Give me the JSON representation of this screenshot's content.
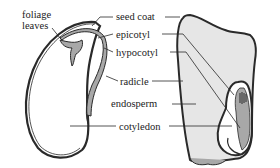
{
  "labels": {
    "foliage_leaves": [
      "foliage",
      "leaves"
    ],
    "seed_coat": "seed coat",
    "epicotyl": "epicotyl",
    "hypocotyl": "hypocotyl",
    "radicle": "radicle",
    "endosperm": "endosperm",
    "cotyledon": "cotyledon"
  },
  "colors": {
    "outline": "#2a2a2a",
    "embryo_fill": "#a8a8a8",
    "endosperm_fill": "#e6e6e6",
    "background": "#ffffff"
  }
}
